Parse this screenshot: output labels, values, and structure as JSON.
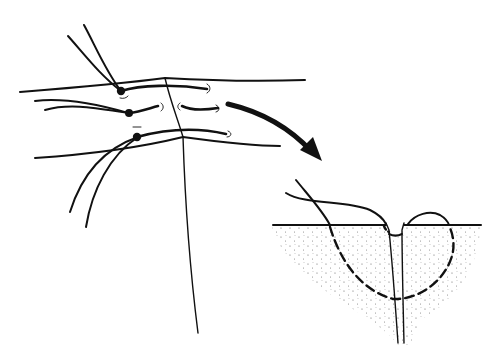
{
  "figure": {
    "type": "line-illustration",
    "colors": {
      "ink": "#111111",
      "background": "#ffffff",
      "stipple": "#555555"
    },
    "panels": [
      {
        "id": "top-view",
        "description": "Skin edges with three suture stitches, knots at left side of incision"
      },
      {
        "id": "cross-section",
        "description": "Cross-section of wound showing buried suture loop (dashed) through stippled tissue"
      }
    ],
    "arrow": {
      "direction": "down-right",
      "from": "top-view",
      "to": "cross-section"
    }
  }
}
